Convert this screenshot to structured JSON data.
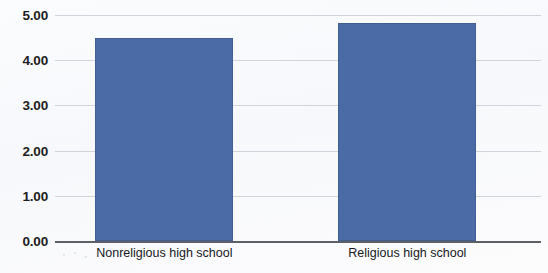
{
  "chart_data": {
    "type": "bar",
    "title": "",
    "subtitle": "",
    "xlabel": "",
    "ylabel": "",
    "categories": [
      "Nonreligious high school",
      "Religious high school"
    ],
    "values": [
      4.5,
      4.83
    ],
    "series": [
      {
        "name": "",
        "values": [
          4.5,
          4.83
        ]
      }
    ],
    "ylim": [
      0.0,
      5.0
    ],
    "ytick_labels": [
      "5.00",
      "4.00",
      "3.00",
      "2.00",
      "1.00",
      "0.00"
    ],
    "ytick_values": [
      5.0,
      4.0,
      3.0,
      2.0,
      1.0,
      0.0
    ],
    "grid": true,
    "legend": false,
    "legend_position": "none",
    "bar_color": "#4a6ba5",
    "gridline_color": "#cfd4dc",
    "axis_color": "#5c5f66",
    "background_color": "#fdfdfe"
  }
}
